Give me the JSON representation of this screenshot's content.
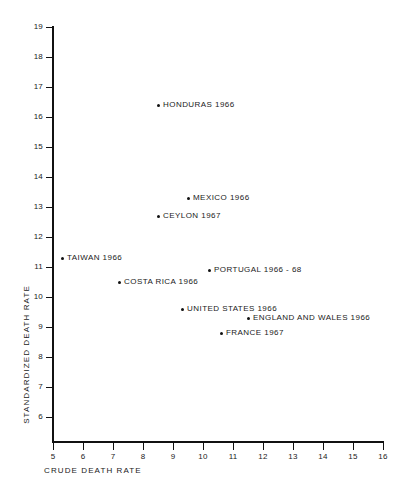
{
  "chart_data": {
    "type": "scatter",
    "title": "",
    "xlabel": "CRUDE  DEATH  RATE",
    "ylabel": "STANDARDIZED  DEATH  RATE",
    "xlim": [
      5,
      16
    ],
    "ylim": [
      6,
      19
    ],
    "xticks": [
      5,
      6,
      7,
      8,
      9,
      10,
      11,
      12,
      13,
      14,
      15,
      16
    ],
    "yticks": [
      6,
      7,
      8,
      9,
      10,
      11,
      12,
      13,
      14,
      15,
      16,
      17,
      18,
      19
    ],
    "xtick_labels": [
      "5",
      "6",
      "7",
      "8",
      "9",
      "10",
      "11",
      "12",
      "13",
      "14",
      "15",
      "16"
    ],
    "ytick_labels": [
      "6",
      "7",
      "8",
      "9",
      "10",
      "11",
      "12",
      "13",
      "14",
      "15",
      "16",
      "17",
      "18",
      "19"
    ],
    "grid": false,
    "legend": "none",
    "marker_color": "#111111",
    "axis_color": "#111111",
    "points": [
      {
        "label": "HONDURAS  1966",
        "x": 8.5,
        "y": 16.4,
        "label_side": "right"
      },
      {
        "label": "MEXICO  1966",
        "x": 9.5,
        "y": 13.3,
        "label_side": "right"
      },
      {
        "label": "CEYLON   1967",
        "x": 8.5,
        "y": 12.7,
        "label_side": "right"
      },
      {
        "label": "TAIWAN  1966",
        "x": 5.3,
        "y": 11.3,
        "label_side": "right"
      },
      {
        "label": "PORTUGAL  1966 - 68",
        "x": 10.2,
        "y": 10.9,
        "label_side": "right"
      },
      {
        "label": "COSTA  RICA  1966",
        "x": 7.2,
        "y": 10.5,
        "label_side": "right"
      },
      {
        "label": "UNITED  STATES  1966",
        "x": 9.3,
        "y": 9.6,
        "label_side": "right"
      },
      {
        "label": "ENGLAND  AND  WALES   1966",
        "x": 11.5,
        "y": 9.3,
        "label_side": "right"
      },
      {
        "label": "FRANCE  1967",
        "x": 10.6,
        "y": 8.8,
        "label_side": "right"
      }
    ]
  }
}
